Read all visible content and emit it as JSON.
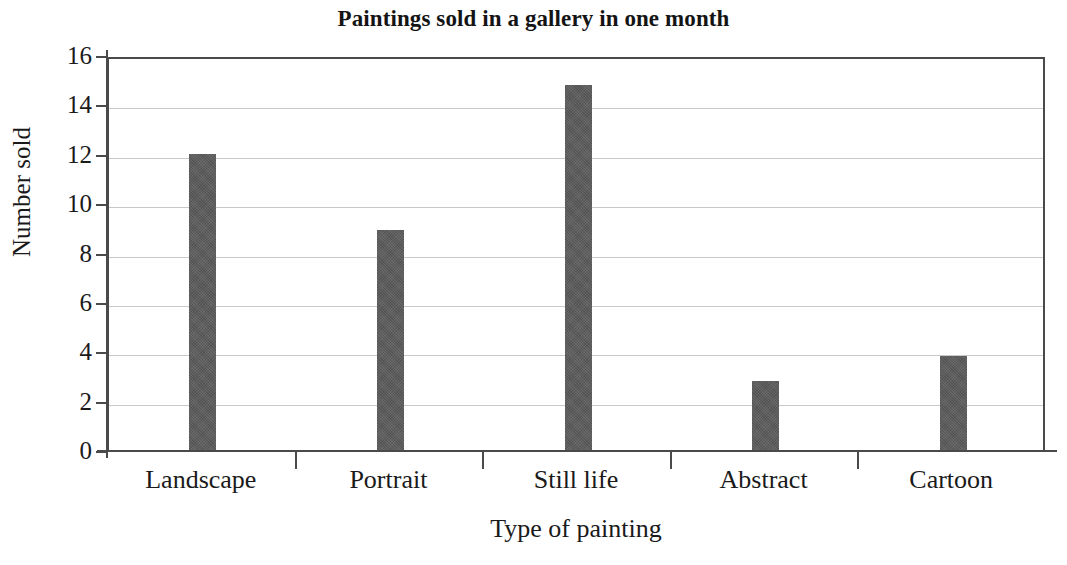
{
  "chart_data": {
    "type": "bar",
    "title": "Paintings sold in a gallery in one month",
    "xlabel": "Type of painting",
    "ylabel": "Number sold",
    "categories": [
      "Landscape",
      "Portrait",
      "Still life",
      "Abstract",
      "Cartoon"
    ],
    "values": [
      12,
      8.9,
      14.8,
      2.8,
      3.8
    ],
    "ylim": [
      0,
      16
    ],
    "ytick_labels": [
      "0",
      "2",
      "4",
      "6",
      "8",
      "10",
      "12",
      "14",
      "16"
    ],
    "ytick_values": [
      0,
      2,
      4,
      6,
      8,
      10,
      12,
      14,
      16
    ],
    "grid": true,
    "grid_axis": "y",
    "legend": false,
    "bar_color": "#5b5b5b",
    "axis_color": "#4a4a4a",
    "grid_color": "#c9c9c9",
    "background": "#ffffff"
  }
}
